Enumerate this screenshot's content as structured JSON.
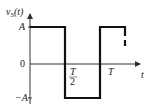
{
  "diagram": {
    "y_axis_label": "v",
    "y_axis_label_sub": "S",
    "y_axis_label_arg": "(t)",
    "x_axis_label": "t",
    "y_ticks": {
      "A": "A",
      "zero": "0",
      "neg_A": "−A"
    },
    "x_ticks": {
      "half_T_num": "T",
      "half_T_den": "2",
      "T": "T"
    },
    "waveform": {
      "type": "square",
      "amplitude": "A",
      "period": "T",
      "segments": [
        {
          "from": "0",
          "to": "T/2",
          "level": "A"
        },
        {
          "from": "T/2",
          "to": "T",
          "level": "-A"
        },
        {
          "from": "T",
          "to": "3T/2",
          "level": "A",
          "continues": "dashed"
        }
      ]
    },
    "colors": {
      "line": "#111111",
      "axis": "#333333"
    }
  }
}
